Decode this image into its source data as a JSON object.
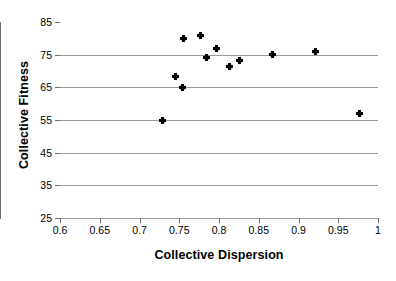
{
  "chart_data": {
    "type": "scatter",
    "title": "",
    "xlabel": "Collective Dispersion",
    "ylabel": "Collective Fitness",
    "xlim": [
      0.6,
      1.0
    ],
    "ylim": [
      25,
      85
    ],
    "grid": "horizontal",
    "legend": "none",
    "marker": "filled-diamond-plus",
    "marker_color": "#000000",
    "gridline_color": "#9a9a9a",
    "axis_color": "#6f6f6f",
    "xticks": [
      "0.6",
      "0.65",
      "0.7",
      "0.75",
      "0.8",
      "0.85",
      "0.9",
      "0.95",
      "1"
    ],
    "xtick_values": [
      0.6,
      0.65,
      0.7,
      0.75,
      0.8,
      0.85,
      0.9,
      0.95,
      1.0
    ],
    "yticks": [
      "25",
      "35",
      "45",
      "55",
      "65",
      "75",
      "85"
    ],
    "ytick_values": [
      25,
      35,
      45,
      55,
      65,
      75,
      85
    ],
    "series": [
      {
        "name": "Collective Fitness vs Collective Dispersion",
        "points": [
          {
            "x": 0.729,
            "y": 55.0
          },
          {
            "x": 0.745,
            "y": 68.2
          },
          {
            "x": 0.754,
            "y": 64.8
          },
          {
            "x": 0.755,
            "y": 80.0
          },
          {
            "x": 0.777,
            "y": 81.0
          },
          {
            "x": 0.784,
            "y": 74.0
          },
          {
            "x": 0.797,
            "y": 77.0
          },
          {
            "x": 0.813,
            "y": 71.5
          },
          {
            "x": 0.826,
            "y": 73.2
          },
          {
            "x": 0.867,
            "y": 75.0
          },
          {
            "x": 0.921,
            "y": 76.0
          },
          {
            "x": 0.977,
            "y": 57.0
          }
        ]
      }
    ]
  }
}
